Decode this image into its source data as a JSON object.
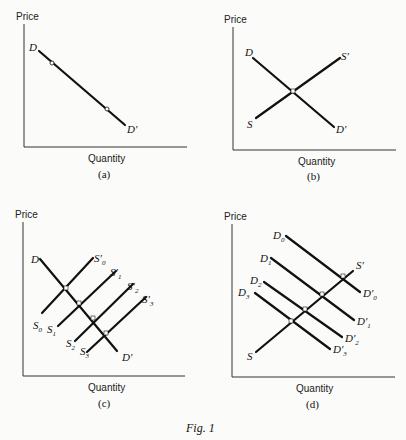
{
  "figure": {
    "caption": "Fig. 1",
    "panels": [
      {
        "id": "a",
        "caption": "(a)",
        "ylabel": "Price",
        "xlabel": "Quantity",
        "curves": [
          {
            "name": "D",
            "start_label": "D",
            "end_label": "D′"
          }
        ],
        "markers": 2
      },
      {
        "id": "b",
        "caption": "(b)",
        "ylabel": "Price",
        "xlabel": "Quantity",
        "curves": [
          {
            "name": "D",
            "start_label": "D",
            "end_label": "D′"
          },
          {
            "name": "S",
            "start_label": "S",
            "end_label": "S′"
          }
        ]
      },
      {
        "id": "c",
        "caption": "(c)",
        "ylabel": "Price",
        "xlabel": "Quantity",
        "curves": [
          {
            "name": "D",
            "start_label": "D",
            "end_label": "D′"
          },
          {
            "name": "S0",
            "start_label": "S",
            "start_sub": "0",
            "end_label": "S′",
            "end_sub": "0"
          },
          {
            "name": "S1",
            "start_label": "S",
            "start_sub": "1",
            "end_label": "S′",
            "end_sub": "1"
          },
          {
            "name": "S2",
            "start_label": "S",
            "start_sub": "2",
            "end_label": "S′",
            "end_sub": "2"
          },
          {
            "name": "S3",
            "start_label": "S",
            "start_sub": "3",
            "end_label": "S′",
            "end_sub": "3"
          }
        ]
      },
      {
        "id": "d",
        "caption": "(d)",
        "ylabel": "Price",
        "xlabel": "Quantity",
        "curves": [
          {
            "name": "D0",
            "start_label": "D",
            "start_sub": "0",
            "end_label": "D′",
            "end_sub": "0"
          },
          {
            "name": "D1",
            "start_label": "D",
            "start_sub": "1",
            "end_label": "D′",
            "end_sub": "1"
          },
          {
            "name": "D2",
            "start_label": "D",
            "start_sub": "2",
            "end_label": "D′",
            "end_sub": "2"
          },
          {
            "name": "D3",
            "start_label": "D",
            "start_sub": "3",
            "end_label": "D′",
            "end_sub": "3"
          },
          {
            "name": "S",
            "start_label": "S",
            "end_label": "S′"
          }
        ]
      }
    ]
  },
  "labels": {
    "price": "Price",
    "quantity": "Quantity",
    "cap_a": "(a)",
    "cap_b": "(b)",
    "cap_c": "(c)",
    "cap_d": "(d)",
    "fig": "Fig. 1",
    "D": "D",
    "Dp": "D′",
    "S": "S",
    "Sp": "S′",
    "sub0": "0",
    "sub1": "1",
    "sub2": "2",
    "sub3": "3"
  }
}
